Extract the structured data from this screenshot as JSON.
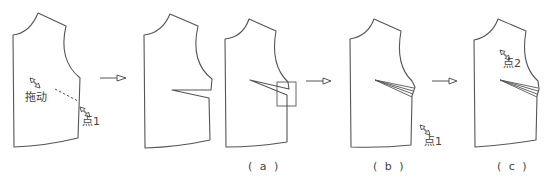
{
  "figure": {
    "type": "pattern-drafting-steps",
    "line_color": "#555555",
    "background": "#ffffff"
  },
  "panels": [
    {
      "id": "step-0",
      "caption": "",
      "labels": [
        "拖动",
        "点1"
      ]
    },
    {
      "id": "step-1",
      "caption": "",
      "labels": []
    },
    {
      "id": "a",
      "caption": "(a)",
      "labels": []
    },
    {
      "id": "b",
      "caption": "(b)",
      "labels": [
        "点1"
      ]
    },
    {
      "id": "c",
      "caption": "(c)",
      "labels": [
        "点2"
      ]
    }
  ],
  "labels": {
    "drag": "拖动",
    "point1_first": "点1",
    "point1_b": "点1",
    "point2": "点2"
  },
  "captions": {
    "a": "( a )",
    "b": "( b )",
    "c": "( c )"
  },
  "arrows": [
    {
      "from": "step-0",
      "to": "step-1"
    },
    {
      "from": "a",
      "to": "b"
    },
    {
      "from": "b",
      "to": "c"
    }
  ]
}
